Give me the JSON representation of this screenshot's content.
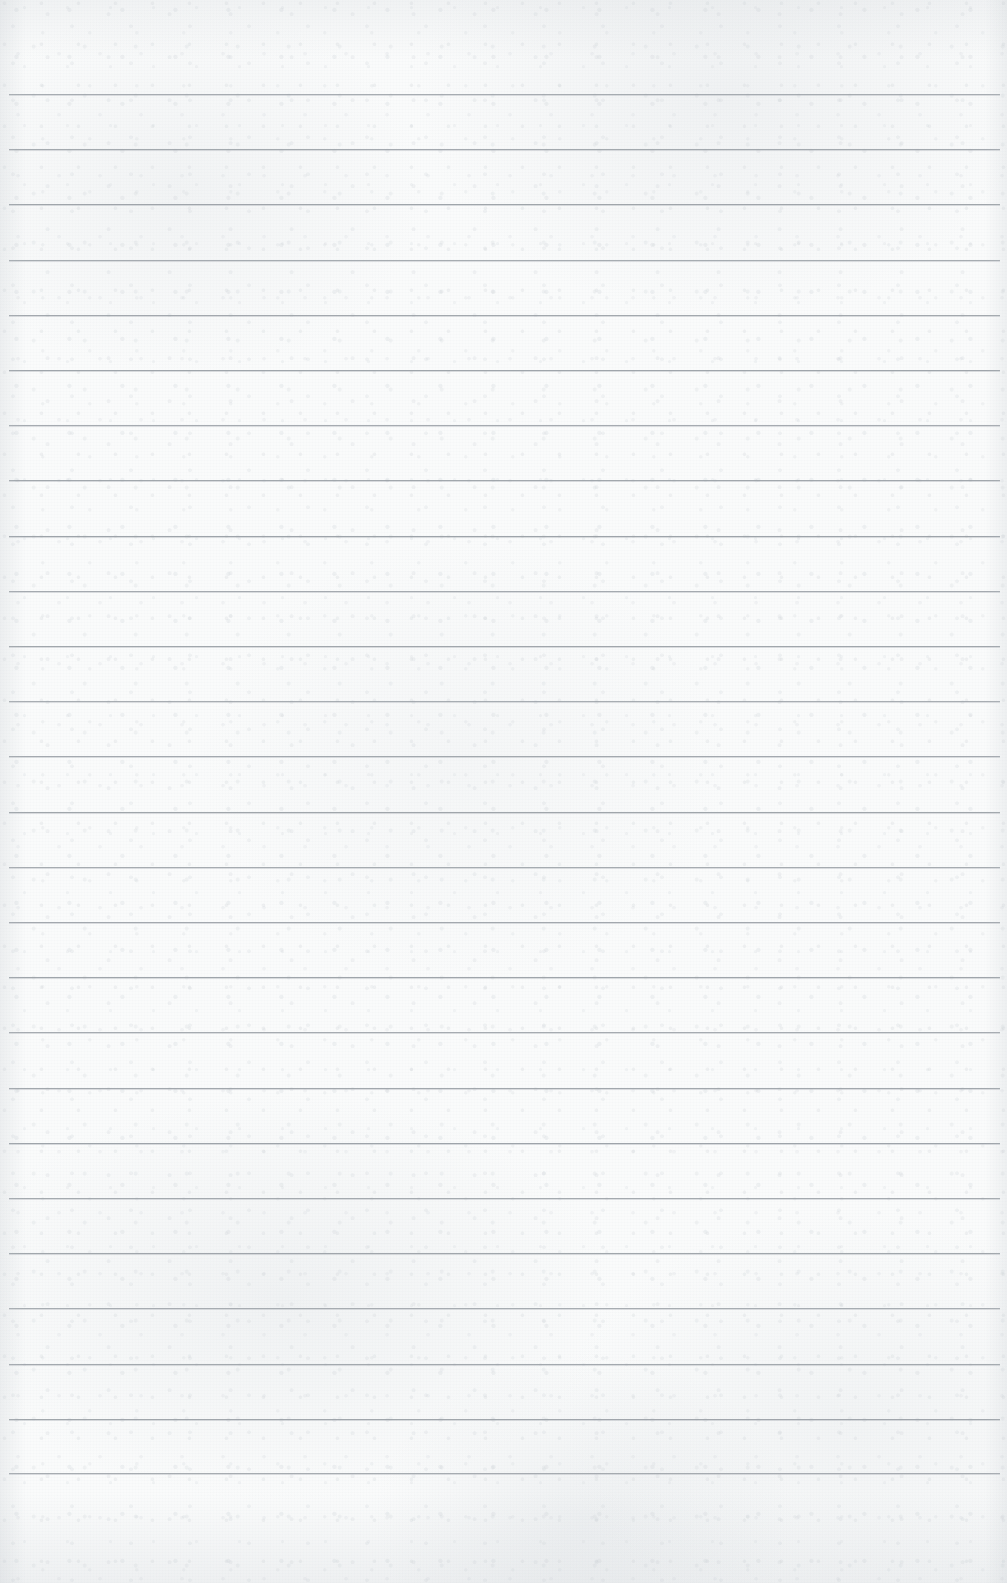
{
  "document": {
    "kind": "ruled-paper-sheet",
    "title": "Blank Ruled Notebook Page",
    "description": "A blank scanned sheet of lined writing paper with horizontal rule lines and no written content.",
    "written_text": "",
    "page_width": 1007,
    "page_height": 1583
  },
  "paper": {
    "background_color": "#fafbfb",
    "grain_color": "#c9ced4",
    "edge_shadow_color": "#bcc2c8",
    "texture": "mottled-fibrous-grain"
  },
  "ruling": {
    "line_color": "#9ba1a7",
    "line_thickness_px": 1,
    "line_count": 26,
    "line_spacing_px": 55.2,
    "first_line_y": 94,
    "last_line_y": 1473,
    "line_start_x": 9,
    "line_end_x": 1000,
    "top_margin_px": 94,
    "bottom_margin_px": 110,
    "left_margin_px": 9,
    "right_margin_px": 7,
    "has_vertical_margin_rule": false,
    "line_y_positions": [
      94,
      149,
      204,
      260,
      315,
      370,
      425,
      480,
      536,
      591,
      646,
      701,
      756,
      812,
      867,
      922,
      977,
      1032,
      1088,
      1143,
      1198,
      1253,
      1308,
      1364,
      1419,
      1473
    ]
  }
}
